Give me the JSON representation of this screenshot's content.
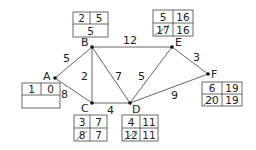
{
  "diagram": {
    "nodes": [
      {
        "id": "A",
        "label": "A",
        "x": 55,
        "y": 78
      },
      {
        "id": "B",
        "label": "B",
        "x": 92,
        "y": 47
      },
      {
        "id": "C",
        "label": "C",
        "x": 92,
        "y": 103
      },
      {
        "id": "D",
        "label": "D",
        "x": 130,
        "y": 103
      },
      {
        "id": "E",
        "label": "E",
        "x": 172,
        "y": 47
      },
      {
        "id": "F",
        "label": "F",
        "x": 208,
        "y": 74
      }
    ],
    "edges": [
      {
        "from": "A",
        "to": "B",
        "weight": "5"
      },
      {
        "from": "A",
        "to": "C",
        "weight": "8"
      },
      {
        "from": "B",
        "to": "C",
        "weight": "2"
      },
      {
        "from": "B",
        "to": "D",
        "weight": "7"
      },
      {
        "from": "B",
        "to": "E",
        "weight": "12"
      },
      {
        "from": "C",
        "to": "D",
        "weight": "4"
      },
      {
        "from": "D",
        "to": "E",
        "weight": "5"
      },
      {
        "from": "D",
        "to": "F",
        "weight": "9"
      },
      {
        "from": "E",
        "to": "F",
        "weight": "3"
      }
    ],
    "boxes": {
      "A": {
        "order": "1",
        "final": "0",
        "working": ""
      },
      "B": {
        "order": "2",
        "final": "5",
        "working": "5"
      },
      "C": {
        "order": "3",
        "final": "7",
        "working_crossed": "8",
        "working": "7"
      },
      "D": {
        "order": "4",
        "final": "11",
        "working_crossed": "12",
        "working": "11"
      },
      "E": {
        "order": "5",
        "final": "16",
        "working_crossed": "17",
        "working": "16"
      },
      "F": {
        "order": "6",
        "final": "19",
        "working_crossed": "20",
        "working": "19"
      }
    }
  }
}
